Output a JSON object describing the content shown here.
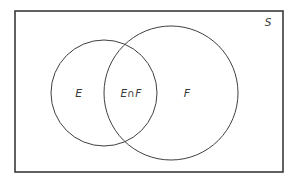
{
  "figure": {
    "kind": "venn-diagram",
    "width": 297,
    "height": 185,
    "background_color": "#ffffff",
    "stroke_color": "#3f3f3f",
    "universe_stroke_color": "#3a3a3a",
    "text_color": "#3a3a3a"
  },
  "universe": {
    "label": "S",
    "label_x": 268,
    "label_y": 26,
    "rect": {
      "x": 15,
      "y": 11,
      "width": 268,
      "height": 161
    },
    "stroke_width": 1.6
  },
  "circles": [
    {
      "id": "set-e",
      "label": "E",
      "cx": 104,
      "cy": 93,
      "r": 53,
      "label_x": 79,
      "label_y": 97,
      "stroke_width": 1
    },
    {
      "id": "set-f",
      "label": "F",
      "cx": 171,
      "cy": 93,
      "r": 67,
      "label_x": 187,
      "label_y": 97,
      "stroke_width": 1
    }
  ],
  "intersection": {
    "id": "set-e-intersect-f",
    "label": "E∩F",
    "label_x": 131,
    "label_y": 97
  }
}
